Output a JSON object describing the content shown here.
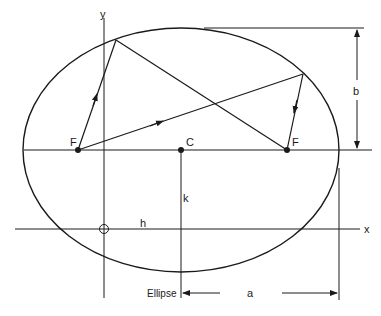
{
  "diagram": {
    "title": "Ellipse",
    "labels": {
      "y_axis": "y",
      "x_axis": "x",
      "focus_left": "F",
      "focus_right": "F",
      "center": "C",
      "semi_major": "a",
      "semi_minor": "b",
      "h": "h",
      "k": "k",
      "caption": "Ellipse"
    },
    "colors": {
      "stroke": "#1a1a1a",
      "background": "#ffffff"
    }
  }
}
